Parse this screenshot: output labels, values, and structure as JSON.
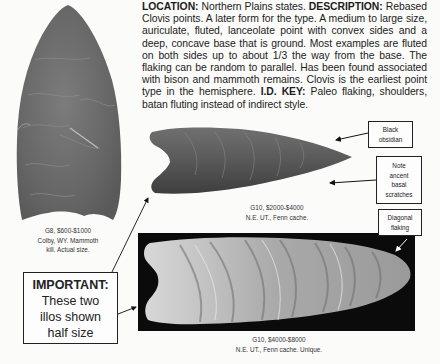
{
  "description": {
    "location_label": "LOCATION:",
    "location_text": " Northern Plains states. ",
    "description_label": "DESCRIPTION:",
    "description_text": " Rebased Clovis points. A later form for the type. A medium to large size, auriculate, fluted, lanceolate point with convex sides and a deep, concave base that is ground. Most examples are fluted on both sides up to about 1/3 the way from the base. The flaking can be random to parallel. Has been found associated with bison and mammoth remains. Clovis is the earliest point type in the hemisphere. ",
    "id_key_label": "I.D. KEY:",
    "id_key_text": " Paleo flaking, shoulders, batan fluting instead of indirect style."
  },
  "figures": [
    {
      "name": "left-point",
      "caption_lines": [
        "G8, $600-$1000",
        "Colby, WY. Mammoth",
        "kill. Actual size."
      ]
    },
    {
      "name": "middle-point",
      "caption_lines": [
        "G10, $2000-$4000",
        "N.E. UT., Fenn cache."
      ]
    },
    {
      "name": "bottom-point",
      "caption_lines": [
        "G10, $4000-$8000",
        "N.E. UT., Fenn cache. Unique."
      ]
    }
  ],
  "callouts": {
    "black_obsidian": [
      "Black",
      "obsidian"
    ],
    "basal_scratches": [
      "Note",
      "ancent",
      "basal",
      "scratches"
    ],
    "diagonal_flaking": [
      "Diagonal",
      "flaking"
    ]
  },
  "important_box": {
    "heading": "IMPORTANT:",
    "lines": [
      "These two",
      "illos shown",
      "half size"
    ]
  },
  "colors": {
    "page": "#fbfbfa",
    "text": "#1c1c1c",
    "photo_background": "#0b0b0b",
    "stone_gray": "#6f6f6f"
  }
}
